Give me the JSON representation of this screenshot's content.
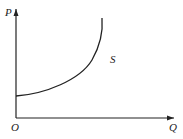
{
  "diagram": {
    "type": "supply-curve",
    "axes": {
      "y_label": "P",
      "x_label": "Q",
      "origin_label": "O"
    },
    "curve": {
      "label": "S",
      "color": "#222222"
    },
    "colors": {
      "axis": "#222222",
      "background": "#ffffff"
    }
  }
}
